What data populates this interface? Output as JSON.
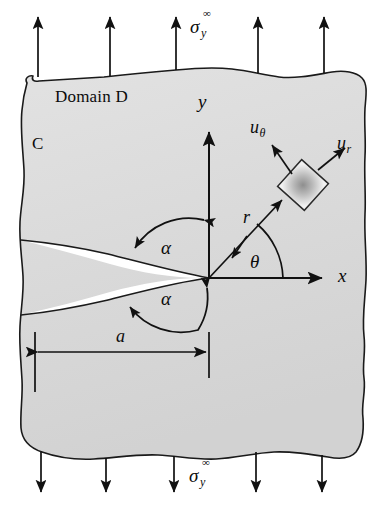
{
  "figure": {
    "type": "engineering-schematic",
    "width": 390,
    "height": 509,
    "background_color": "#ffffff",
    "domain_fill_color": "#dedede",
    "line_color": "#111111",
    "crack_fill_color": "#ffffff"
  },
  "labels": {
    "domain": "Domain D",
    "boundary_curve": "C",
    "x_axis": "x",
    "y_axis": "y",
    "radius": "r",
    "theta": "θ",
    "alpha_upper": "α",
    "alpha_lower": "α",
    "crack_length": "a",
    "u_theta_base": "u",
    "u_theta_sub": "θ",
    "u_r_base": "u",
    "u_r_sub": "r"
  },
  "stress": {
    "top": {
      "symbol": "σ",
      "superscript": "∞",
      "subscript": "y",
      "direction": "up",
      "arrow_count": 5
    },
    "bottom": {
      "symbol": "σ",
      "superscript": "∞",
      "subscript": "y",
      "direction": "down",
      "arrow_count": 5
    }
  },
  "geometry": {
    "origin_x": 209,
    "origin_y": 278,
    "crack_tip_x": 209,
    "crack_tip_y": 278,
    "crack_length_px": 174,
    "theta_degrees": 47,
    "alpha_upper_degrees": 146,
    "alpha_lower_degrees": 146
  }
}
